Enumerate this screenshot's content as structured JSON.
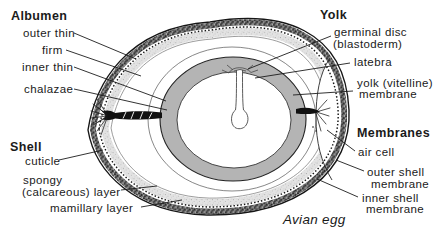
{
  "figure_caption": "Avian egg",
  "colors": {
    "yolk_gray": "#b4b4b4",
    "shell_dark": "#757575",
    "shell_light": "#e3e3e3",
    "ink": "#1a1a1a"
  },
  "sections": {
    "albumen": {
      "header": "Albumen",
      "outer_thin": "outer thin",
      "firm": "firm",
      "inner_thin": "inner thin",
      "chalazae": "chalazae"
    },
    "shell": {
      "header": "Shell",
      "cuticle": "cuticle",
      "spongy_line1": "spongy",
      "spongy_line2": "(calcareous) layer",
      "mamillary": "mamillary layer"
    },
    "yolk": {
      "header": "Yolk",
      "germinal_line1": "germinal disc",
      "germinal_line2": "(blastoderm)",
      "latebra": "latebra",
      "vitelline_line1": "yolk (vitelline)",
      "vitelline_line2": "membrane"
    },
    "membranes": {
      "header": "Membranes",
      "air_cell": "air cell",
      "outer_line1": "outer shell",
      "outer_line2": "membrane",
      "inner_line1": "inner shell",
      "inner_line2": "membrane"
    }
  }
}
